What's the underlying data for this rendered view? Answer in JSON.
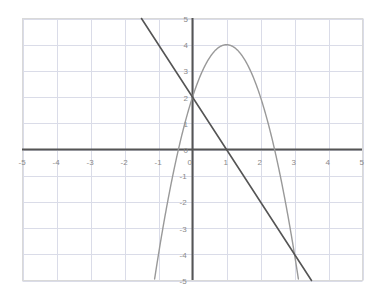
{
  "chart_data": {
    "type": "line",
    "title": "",
    "xlabel": "",
    "ylabel": "",
    "xlim": [
      -5,
      5
    ],
    "ylim": [
      -5,
      5
    ],
    "grid": true,
    "grid_step": 1,
    "legend": "none",
    "x_ticks": [
      "-5",
      "-4",
      "-3",
      "-2",
      "-1",
      "0",
      "1",
      "2",
      "3",
      "4",
      "5"
    ],
    "y_ticks": [
      "5",
      "4",
      "3",
      "2",
      "1",
      "0",
      "-1",
      "-2",
      "-3",
      "-4",
      "-5"
    ],
    "axis_color": "#555555",
    "grid_color": "#dadce8",
    "border_color": "#d9d9d9",
    "tick_label_color": "#8a8a8a",
    "series": [
      {
        "name": "line",
        "kind": "line",
        "equation": "y = -2x + 2",
        "slope": -2,
        "intercept": 2,
        "color": "#555555",
        "width": 1.6,
        "x_intercept": 1,
        "y_intercept": 2,
        "points": [
          {
            "x": -1.5,
            "y": 5
          },
          {
            "x": -1,
            "y": 4
          },
          {
            "x": 0,
            "y": 2
          },
          {
            "x": 1,
            "y": 0
          },
          {
            "x": 2,
            "y": -2
          },
          {
            "x": 3,
            "y": -4
          },
          {
            "x": 3.5,
            "y": -5
          }
        ]
      },
      {
        "name": "parabola",
        "kind": "parabola",
        "equation": "y = -2(x - 1)^2 + 4",
        "a": -2,
        "vertex_x": 1,
        "vertex_y": 4,
        "color": "#999999",
        "width": 1.4,
        "y_intercept": 2,
        "roots": [
          -0.414,
          2.414
        ],
        "points": [
          {
            "x": -1.12,
            "y": -5
          },
          {
            "x": -1,
            "y": -4
          },
          {
            "x": -0.5,
            "y": -0.5
          },
          {
            "x": -0.414,
            "y": 0
          },
          {
            "x": 0,
            "y": 2
          },
          {
            "x": 0.5,
            "y": 3.5
          },
          {
            "x": 1,
            "y": 4
          },
          {
            "x": 1.5,
            "y": 3.5
          },
          {
            "x": 2,
            "y": 2
          },
          {
            "x": 2.414,
            "y": 0
          },
          {
            "x": 2.5,
            "y": -0.5
          },
          {
            "x": 3,
            "y": -4
          },
          {
            "x": 3.12,
            "y": -5
          }
        ]
      }
    ],
    "intersections": [
      {
        "x": 0,
        "y": 2
      },
      {
        "x": 3,
        "y": -4
      }
    ]
  }
}
